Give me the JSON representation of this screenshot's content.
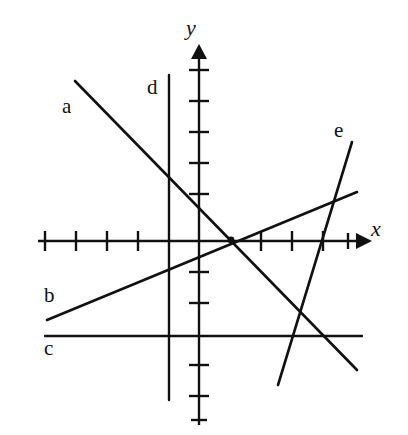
{
  "figure": {
    "background_color": "#ffffff",
    "stroke_color": "#111111",
    "width": 408,
    "height": 435
  },
  "axes": {
    "x_axis": {
      "label": "x",
      "label_style": "italic",
      "y_pixel": 241,
      "start_x": 38,
      "end_x": 362,
      "arrow": "right",
      "tick_count": 10,
      "tick_pixels": [
        45,
        76,
        107,
        138,
        169,
        199,
        230,
        261,
        292,
        323
      ],
      "tick_values": [
        -5,
        -4,
        -3,
        -2,
        -1,
        0,
        1,
        2,
        3,
        4
      ]
    },
    "y_axis": {
      "label": "y",
      "label_style": "italic",
      "x_pixel": 199,
      "start_y": 425,
      "end_y": 44,
      "arrow": "up",
      "tick_count": 11,
      "tick_pixels": [
        70,
        101,
        132,
        163,
        194,
        272,
        303,
        334,
        365,
        396,
        420
      ],
      "tick_values": [
        5.5,
        4.5,
        3.5,
        2.5,
        1.5,
        -1,
        -2,
        -3,
        -4,
        -5,
        -5.8
      ]
    },
    "origin": {
      "x_pixel": 199,
      "y_pixel": 241
    },
    "unit_pixels": 31
  },
  "lines": [
    {
      "id": "a",
      "label": "a",
      "description": "steep negative-slope line from upper left to lower right",
      "x1": 75,
      "y1": 81,
      "x2": 357,
      "y2": 370,
      "slope_sign": "negative"
    },
    {
      "id": "b",
      "label": "b",
      "description": "shallow positive-slope line from lower left to mid right",
      "x1": 47,
      "y1": 320,
      "x2": 357,
      "y2": 192,
      "slope_sign": "positive"
    },
    {
      "id": "c",
      "label": "c",
      "description": "horizontal line below the x-axis",
      "x1": 45,
      "y1": 336,
      "x2": 362,
      "y2": 336,
      "slope_sign": "zero"
    },
    {
      "id": "d",
      "label": "d",
      "description": "vertical line left of the y-axis",
      "x1": 169,
      "y1": 75,
      "x2": 169,
      "y2": 400,
      "slope_sign": "undefined"
    },
    {
      "id": "e",
      "label": "e",
      "description": "steep positive-slope line on the right side",
      "x1": 352,
      "y1": 142,
      "x2": 278,
      "y2": 385,
      "slope_sign": "positive-steep"
    }
  ],
  "intersection_marker": {
    "description": "lines a, b and the x-axis meet at one point",
    "x_pixel": 231,
    "y_pixel": 240
  }
}
